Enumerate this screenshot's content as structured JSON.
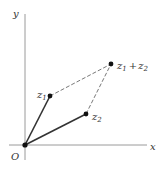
{
  "diagram": {
    "axes": {
      "x_label": "x",
      "y_label": "y",
      "origin_label": "O"
    },
    "points": {
      "z1": {
        "label_main": "z",
        "label_sub": "1"
      },
      "z2": {
        "label_main": "z",
        "label_sub": "2"
      },
      "sum": {
        "label_a_main": "z",
        "label_a_sub": "1",
        "plus": "+",
        "label_b_main": "z",
        "label_b_sub": "2"
      }
    },
    "colors": {
      "axis": "#9a9a9a",
      "vector": "#333333",
      "dashed": "#555555",
      "point": "#111111"
    }
  }
}
